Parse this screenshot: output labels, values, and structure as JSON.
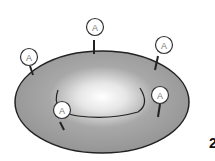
{
  "diagram": {
    "antigen_label": "A",
    "antigens": [
      {
        "id": "top-left",
        "label": "A"
      },
      {
        "id": "top-center",
        "label": "A"
      },
      {
        "id": "top-right",
        "label": "A"
      },
      {
        "id": "inner-left",
        "label": "A"
      },
      {
        "id": "inner-right",
        "label": "A"
      }
    ],
    "edge_text": "2",
    "colors": {
      "cell_fill": "#9a9a9a",
      "cell_center": "#ffffff",
      "outline": "#222222"
    }
  }
}
